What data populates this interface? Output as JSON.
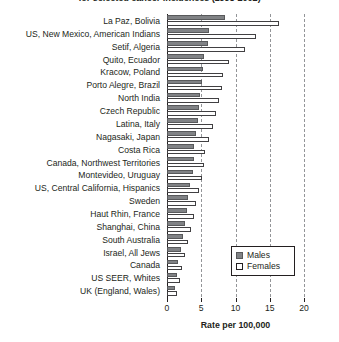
{
  "chart_data": {
    "type": "bar",
    "orientation": "horizontal",
    "title": "for selected cancer incidences (1998-2002)",
    "xlabel": "Rate per 100,000",
    "ylabel": "",
    "xlim": [
      0,
      20
    ],
    "xticks": [
      0,
      5,
      10,
      15,
      20
    ],
    "grid": true,
    "legend_position": "bottom-right",
    "categories": [
      "La Paz, Bolivia",
      "US, New Mexico, American Indians",
      "Setif, Algeria",
      "Quito, Ecuador",
      "Kracow, Poland",
      "Porto Alegre, Brazil",
      "North India",
      "Czech Republic",
      "Latina, Italy",
      "Nagasaki, Japan",
      "Costa Rica",
      "Canada, Northwest Territories",
      "Montevideo, Uruguay",
      "US, Central California, Hispanics",
      "Sweden",
      "Haut Rhin, France",
      "Shanghai, China",
      "South Australia",
      "Israel, All Jews",
      "Canada",
      "US SEER, Whites",
      "UK (England, Wales)"
    ],
    "series": [
      {
        "name": "Males",
        "color": "#808285",
        "values": [
          8.5,
          6.1,
          6.0,
          5.4,
          5.2,
          5.1,
          4.8,
          4.6,
          4.5,
          4.3,
          4.0,
          3.9,
          3.8,
          3.3,
          3.1,
          2.9,
          2.6,
          2.3,
          2.0,
          1.6,
          1.4,
          1.1
        ]
      },
      {
        "name": "Females",
        "color": "#ffffff",
        "values": [
          16.3,
          13.0,
          11.4,
          9.0,
          8.2,
          8.0,
          7.6,
          7.2,
          6.7,
          6.1,
          5.6,
          5.4,
          5.1,
          4.6,
          4.3,
          4.0,
          3.5,
          3.1,
          2.7,
          2.2,
          1.9,
          1.5
        ]
      }
    ]
  },
  "legend": {
    "items": [
      {
        "label": "Males"
      },
      {
        "label": "Females"
      }
    ]
  },
  "colors": {
    "male_fill": "#808285",
    "female_fill": "#ffffff",
    "axis": "#231f20",
    "gridline": "#939598"
  }
}
